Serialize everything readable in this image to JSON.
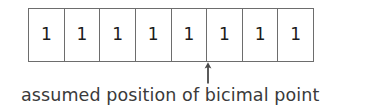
{
  "figure": {
    "background_color": "#ffffff",
    "line_color": "#6d6d6d",
    "text_color": "#3a3a3a",
    "digit_color": "#1b1b1b"
  },
  "bit_table": {
    "cell_count": 8,
    "cells": [
      {
        "value": "1"
      },
      {
        "value": "1"
      },
      {
        "value": "1"
      },
      {
        "value": "1"
      },
      {
        "value": "1"
      },
      {
        "value": "1"
      },
      {
        "value": "1"
      },
      {
        "value": "1"
      }
    ]
  },
  "marker": {
    "icon": "up-arrow-icon",
    "points_after_cell_index": 5,
    "color": "#4a4a4a"
  },
  "caption": {
    "text": "assumed position of bicimal point"
  }
}
